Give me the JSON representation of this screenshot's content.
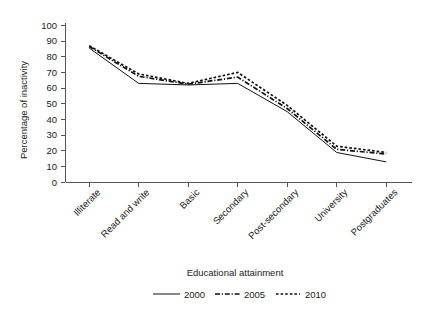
{
  "chart_data": {
    "type": "line",
    "title": "",
    "xlabel": "Educational attainment",
    "ylabel": "Percentage of inactivity",
    "categories": [
      "Illiterate",
      "Read and write",
      "Basic",
      "Secondary",
      "Post-secondary",
      "University",
      "Postgraduates"
    ],
    "ylim": [
      0,
      100
    ],
    "yticks": [
      0,
      10,
      20,
      30,
      40,
      50,
      60,
      70,
      80,
      90,
      100
    ],
    "ytick_labels": [
      "0",
      "10",
      "20",
      "30",
      "40",
      "50",
      "60",
      "70",
      "80",
      "90",
      "100"
    ],
    "grid": false,
    "legend_position": "bottom",
    "series": [
      {
        "name": "2000",
        "style": "solid",
        "color": "#111111",
        "values": [
          85.5,
          63.0,
          62.0,
          63.0,
          45.0,
          19.0,
          13.0
        ]
      },
      {
        "name": "2005",
        "style": "dash-dot",
        "color": "#111111",
        "values": [
          86.5,
          67.5,
          62.5,
          67.0,
          47.0,
          21.0,
          18.0
        ]
      },
      {
        "name": "2010",
        "style": "dashed",
        "color": "#111111",
        "values": [
          87.0,
          69.0,
          63.0,
          70.0,
          49.0,
          23.0,
          19.0
        ]
      }
    ]
  },
  "axes": {
    "y_label_text": "Percentage of inactivity",
    "x_label_text": "Educational attainment"
  },
  "legend": {
    "items": [
      {
        "label": "2000",
        "style": "solid"
      },
      {
        "label": "2005",
        "style": "dash-dot"
      },
      {
        "label": "2010",
        "style": "dashed"
      }
    ]
  }
}
